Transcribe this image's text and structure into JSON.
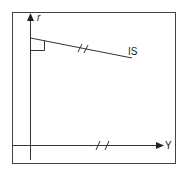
{
  "diagram": {
    "type": "economics-axis-diagram",
    "axes": {
      "vertical_label": "r",
      "horizontal_label": "Y"
    },
    "curves": [
      {
        "label": "IS",
        "description": "downward-sloping line starting at r-axis"
      }
    ],
    "annotations": [
      {
        "type": "right-angle-marker",
        "location": "intersection of IS with r-axis"
      },
      {
        "type": "double-slash-tick",
        "location": "on IS line"
      },
      {
        "type": "double-slash-tick",
        "location": "on Y axis"
      }
    ],
    "colors": {
      "line": "#333333",
      "frame": "#444444",
      "background": "#ffffff"
    }
  }
}
